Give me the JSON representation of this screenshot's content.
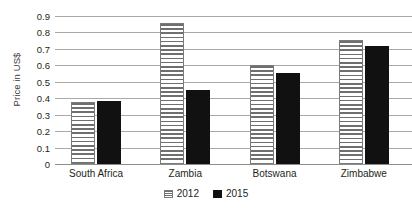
{
  "chart_data": {
    "type": "bar",
    "title": "",
    "subtitle": "",
    "xlabel": "",
    "ylabel": "Price in US$",
    "categories": [
      "South Africa",
      "Zambia",
      "Botswana",
      "Zimbabwe"
    ],
    "series": [
      {
        "name": "2012",
        "values": [
          0.375,
          0.855,
          0.6,
          0.755
        ],
        "pattern": "horizontal-stripes",
        "color": "#6f6f6f"
      },
      {
        "name": "2015",
        "values": [
          0.385,
          0.45,
          0.555,
          0.72
        ],
        "pattern": "solid",
        "color": "#111111"
      }
    ],
    "ylim": [
      0,
      0.9
    ],
    "ytick_values": [
      0,
      0.1,
      0.2,
      0.3,
      0.4,
      0.5,
      0.6,
      0.7,
      0.8,
      0.9
    ],
    "ytick_labels": [
      "0",
      "0.1",
      "0.2",
      "0.3",
      "0.4",
      "0.5",
      "0.6",
      "0.7",
      "0.8",
      "0.9"
    ],
    "grid": true,
    "grid_axis": "y",
    "legend_position": "bottom",
    "legend_entries": [
      "2012",
      "2015"
    ]
  },
  "axis": {
    "y_title": "Price in US$",
    "ticks": [
      {
        "label": "0.9",
        "value": 0.9
      },
      {
        "label": "0.8",
        "value": 0.8
      },
      {
        "label": "0.7",
        "value": 0.7
      },
      {
        "label": "0.6",
        "value": 0.6
      },
      {
        "label": "0.5",
        "value": 0.5
      },
      {
        "label": "0.4",
        "value": 0.4
      },
      {
        "label": "0.3",
        "value": 0.3
      },
      {
        "label": "0.2",
        "value": 0.2
      },
      {
        "label": "0.1",
        "value": 0.1
      },
      {
        "label": "0",
        "value": 0
      }
    ]
  },
  "categories": [
    {
      "label": "South Africa"
    },
    {
      "label": "Zambia"
    },
    {
      "label": "Botswana"
    },
    {
      "label": "Zimbabwe"
    }
  ],
  "legend": {
    "items": [
      {
        "label": "2012"
      },
      {
        "label": "2015"
      }
    ]
  },
  "colors": {
    "series_2012": "#6f6f6f",
    "series_2015": "#111111",
    "gridline": "#a9a9a9",
    "text": "#231f20",
    "background": "#ffffff"
  }
}
